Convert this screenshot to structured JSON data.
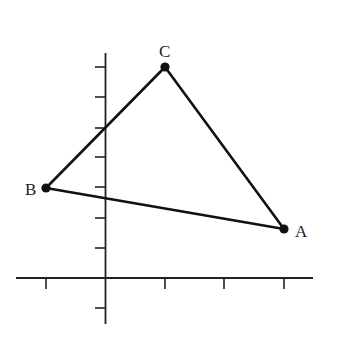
{
  "diagram": {
    "type": "triangle-on-coordinate-plane",
    "colors": {
      "line": "#111111",
      "axis": "#222222",
      "background": "#ffffff"
    },
    "axes": {
      "x_ticks": [
        -1,
        1,
        2,
        3
      ],
      "y_ticks": [
        -1,
        1,
        2,
        3,
        4,
        5,
        6,
        7
      ],
      "tick_labels_shown": false
    },
    "points": [
      {
        "label": "A",
        "x": 3,
        "y": 1.6
      },
      {
        "label": "B",
        "x": -1,
        "y": 3
      },
      {
        "label": "C",
        "x": 1,
        "y": 7
      }
    ],
    "segments": [
      [
        "A",
        "B"
      ],
      [
        "B",
        "C"
      ],
      [
        "C",
        "A"
      ]
    ]
  }
}
